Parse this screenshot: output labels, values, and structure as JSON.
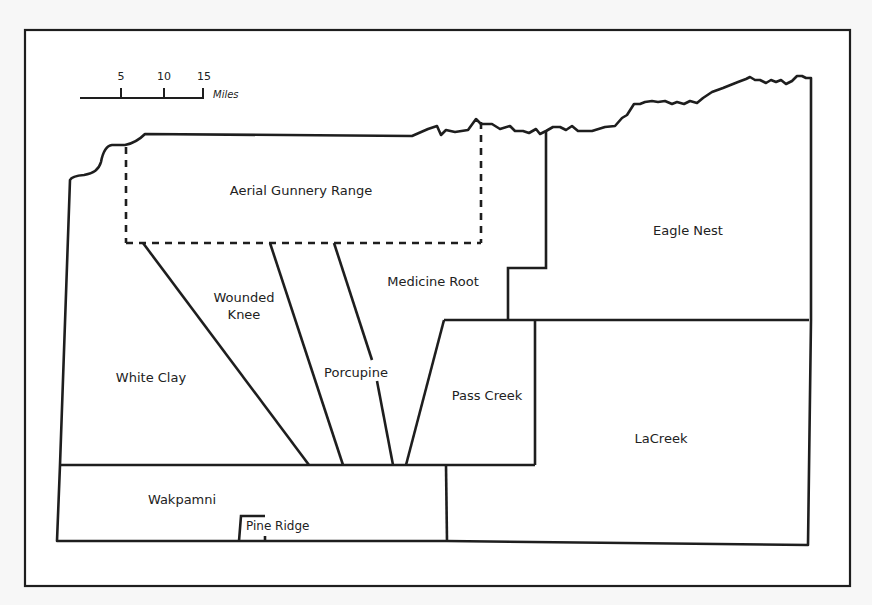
{
  "map": {
    "title": "Pine Ridge Reservation districts",
    "colors": {
      "background": "#f7f7f7",
      "frame_fill": "#ffffff",
      "line": "#1e1e1e"
    },
    "scale_bar": {
      "ticks": [
        "5",
        "10",
        "15"
      ],
      "unit": "Miles"
    },
    "regions": {
      "aerial_gunnery_range": "Aerial Gunnery Range",
      "eagle_nest": "Eagle Nest",
      "medicine_root": "Medicine Root",
      "wounded_knee": "Wounded\nKnee",
      "white_clay": "White Clay",
      "porcupine": "Porcupine",
      "pass_creek": "Pass Creek",
      "lacreek": "LaCreek",
      "wakpamni": "Wakpamni",
      "pine_ridge": "Pine Ridge"
    }
  }
}
